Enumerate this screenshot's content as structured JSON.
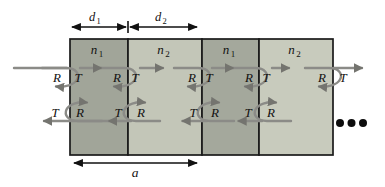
{
  "diagram": {
    "type": "multilayer-stack-reflection-transmission-schematic",
    "wave_labels": {
      "reflection": "R",
      "transmission": "T"
    },
    "dimension_labels": {
      "d1": {
        "base": "d",
        "sub": "1"
      },
      "d2": {
        "base": "d",
        "sub": "2"
      },
      "period": "a"
    },
    "layers": [
      {
        "index_base": "n",
        "index_sub": "1",
        "fill": "#a1a599"
      },
      {
        "index_base": "n",
        "index_sub": "2",
        "fill": "#c3c6b8"
      },
      {
        "index_base": "n",
        "index_sub": "1",
        "fill": "#a4a89c"
      },
      {
        "index_base": "n",
        "index_sub": "2",
        "fill": "#c8cbbd"
      }
    ],
    "icons": {
      "continuation_ellipsis": "three-dots"
    },
    "colors": {
      "background": "#ffffff",
      "layer_border": "#1a1a1a",
      "wave_arrow": "#8b8b87",
      "wave_arrowhead": "#74746f",
      "dimension_arrow": "#111111",
      "ellipsis_dots": "#0d0d0d"
    }
  }
}
